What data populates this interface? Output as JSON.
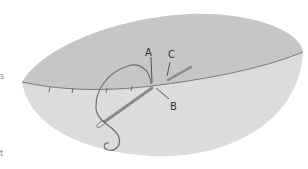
{
  "diagram": {
    "type": "sewing-stitch-illustration",
    "labels": {
      "a": "A",
      "b": "B",
      "c": "C"
    },
    "edge_fragments": {
      "upper": "s",
      "lower": "t"
    },
    "colors": {
      "top_fabric": "#c4c4c4",
      "bottom_fabric": "#dadada",
      "seam_line": "#7a7a7a",
      "thread": "#6f6f6f",
      "needle": "#8a8a8a",
      "label": "#333333"
    }
  }
}
